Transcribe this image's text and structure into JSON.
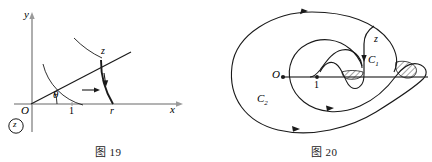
{
  "page": {
    "background_color": "#ffffff",
    "ink_color": "#1a1a1a",
    "axis_color": "#9a9a9a",
    "width": 432,
    "height": 162
  },
  "figure19": {
    "caption": "图 19",
    "labels": {
      "y_axis": "y",
      "x_axis": "x",
      "origin": "O",
      "angle": "θ",
      "unit_point": "1",
      "radius_point": "r",
      "point_z": "z",
      "circled_z": "z"
    },
    "geometry": {
      "origin_px": [
        32,
        104
      ],
      "x_axis_end_px": [
        182,
        104
      ],
      "y_axis_top_px": [
        32,
        14
      ],
      "ray_angle_deg": 27,
      "ray_end_px": [
        128,
        55
      ],
      "unit_tick_px": [
        72,
        104
      ],
      "radius_tick_px": [
        113,
        104
      ]
    },
    "annotations": {
      "radial_arrow_direction": "right",
      "arc_arrow_direction": "down"
    }
  },
  "figure20": {
    "caption": "图 20",
    "labels": {
      "origin": "O",
      "unit_point": "1",
      "point_z": "z",
      "contour_inner": "C",
      "contour_inner_sub": "1",
      "contour_outer": "C",
      "contour_outer_sub": "2"
    },
    "geometry": {
      "origin_px": [
        67,
        77
      ],
      "branch_cut_start_px": [
        67,
        77
      ],
      "branch_cut_end_px": [
        212,
        77
      ],
      "unit_point_px": [
        101,
        77
      ]
    },
    "annotations": {
      "hatched_region_count": 2,
      "arrow_count": 4,
      "arrow_directions": [
        "right",
        "down",
        "right",
        "right"
      ]
    }
  }
}
